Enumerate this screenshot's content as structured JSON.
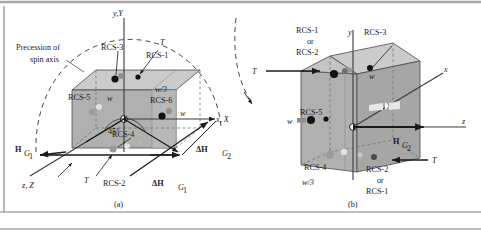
{
  "figure": {
    "background": "#ffffff",
    "frame_color": "#9a9a9a",
    "body_fill": "#b3b3b3",
    "body_top_fill": "#cfcfcf",
    "body_side_fill": "#a6a6a6",
    "line_color": "#1a1a1a"
  },
  "panel_a": {
    "caption": "(a)",
    "annotation_precession_line1": "Precession of",
    "annotation_precession_line2": "spin axis",
    "axis_y": "y,Y",
    "axis_x": "x, X",
    "axis_z": "z, Z",
    "torque_top": "T",
    "torque_bottom": "T",
    "rcs_3": "RCS-3",
    "rcs_1": "RCS-1",
    "rcs_5": "RCS-5",
    "rcs_6": "RCS-6",
    "rcs_4": "RCS-4",
    "rcs_2": "RCS-2",
    "dim_w_top": "w",
    "dim_w3_top": "w/3",
    "dim_w_right": "w",
    "angle": "45°",
    "vec_H": "H",
    "vec_H_sub": "G",
    "vec_H_sub2": "1",
    "vec_dH": "ΔH",
    "vec_dH_sub": "G",
    "vec_dH_sub2": "1",
    "vec_dH2": "ΔH",
    "vec_dH2_sub": "G",
    "vec_dH2_sub2": "2"
  },
  "panel_b": {
    "caption": "(b)",
    "axis_y": "y",
    "axis_x": "x",
    "axis_z": "z",
    "torque_left": "T",
    "torque_right": "T",
    "rcs_1_or_line1": "RCS-1",
    "rcs_1_or_line2": "or",
    "rcs_1_or_line3": "RCS-2",
    "rcs_3": "RCS-3",
    "rcs_5": "RCS-5",
    "rcs_4": "RCS-4",
    "rcs_2_or_line1": "RCS-2",
    "rcs_2_or_line2": "or",
    "rcs_2_or_line3": "RCS-1",
    "dim_w_top": "w",
    "dim_w_left": "w",
    "dim_w3_bottom": "w/3",
    "vec_H": "H",
    "vec_H_sub": "G",
    "vec_H_sub2": "2"
  }
}
